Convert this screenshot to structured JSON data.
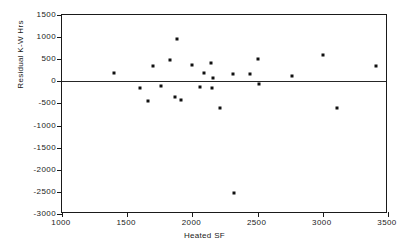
{
  "chart_data": {
    "type": "scatter",
    "title": "",
    "xlabel": "Heated SF",
    "ylabel": "Residual K-W Hrs",
    "xlim": [
      1000,
      3500
    ],
    "ylim": [
      -3000,
      1500
    ],
    "xticks": [
      1000,
      1500,
      2000,
      2500,
      3000,
      3500
    ],
    "yticks": [
      1500,
      1000,
      500,
      0,
      -500,
      -1000,
      -1500,
      -2000,
      -2500,
      -3000
    ],
    "xtick_labels": [
      "1000",
      "1500",
      "2000",
      "2500",
      "3000",
      "3500"
    ],
    "ytick_labels": [
      "1500",
      "1000",
      "500",
      "0",
      "-500",
      "-1000",
      "-1500",
      "-2000",
      "-2500",
      "-3000"
    ],
    "grid": false,
    "legend": null,
    "reference_line": {
      "y": 0,
      "style": "solid"
    },
    "marker": {
      "shape": "square",
      "color": "#111111",
      "size": 3
    },
    "points": [
      {
        "x": 1400,
        "y": 180
      },
      {
        "x": 1600,
        "y": -150
      },
      {
        "x": 1660,
        "y": -440
      },
      {
        "x": 1700,
        "y": 350
      },
      {
        "x": 1760,
        "y": -110
      },
      {
        "x": 1830,
        "y": 490
      },
      {
        "x": 1870,
        "y": -350
      },
      {
        "x": 1885,
        "y": 955
      },
      {
        "x": 1910,
        "y": -420
      },
      {
        "x": 2000,
        "y": 375
      },
      {
        "x": 2060,
        "y": -125
      },
      {
        "x": 2090,
        "y": 185
      },
      {
        "x": 2140,
        "y": 415
      },
      {
        "x": 2150,
        "y": -155
      },
      {
        "x": 2160,
        "y": 85
      },
      {
        "x": 2210,
        "y": -600
      },
      {
        "x": 2310,
        "y": 160
      },
      {
        "x": 2320,
        "y": -2520
      },
      {
        "x": 2440,
        "y": 160
      },
      {
        "x": 2500,
        "y": 495
      },
      {
        "x": 2510,
        "y": -65
      },
      {
        "x": 2760,
        "y": 125
      },
      {
        "x": 3000,
        "y": 590
      },
      {
        "x": 3110,
        "y": -610
      },
      {
        "x": 3410,
        "y": 340
      }
    ]
  }
}
